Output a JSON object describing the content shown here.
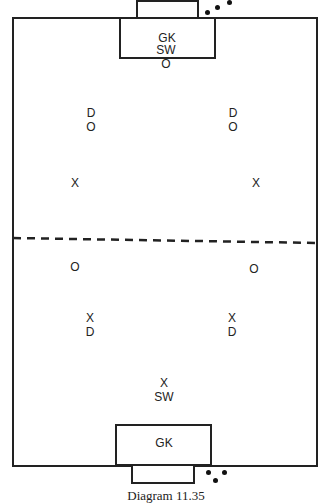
{
  "diagram": {
    "caption": "Diagram 11.35",
    "colors": {
      "lines": "#222222",
      "background": "#ffffff"
    },
    "top_goal": {
      "keeper_label": "GK"
    },
    "bottom_goal": {
      "keeper_label": "GK"
    },
    "players": [
      {
        "label": "SW",
        "x": 166,
        "y": 50
      },
      {
        "label": "O",
        "x": 166,
        "y": 64
      },
      {
        "label": "D",
        "x": 91,
        "y": 113
      },
      {
        "label": "O",
        "x": 91,
        "y": 127
      },
      {
        "label": "D",
        "x": 233,
        "y": 113
      },
      {
        "label": "O",
        "x": 233,
        "y": 127
      },
      {
        "label": "X",
        "x": 75,
        "y": 183
      },
      {
        "label": "X",
        "x": 256,
        "y": 183
      },
      {
        "label": "O",
        "x": 75,
        "y": 267
      },
      {
        "label": "O",
        "x": 254,
        "y": 269
      },
      {
        "label": "X",
        "x": 90,
        "y": 318
      },
      {
        "label": "D",
        "x": 90,
        "y": 332
      },
      {
        "label": "X",
        "x": 232,
        "y": 318
      },
      {
        "label": "D",
        "x": 232,
        "y": 332
      },
      {
        "label": "X",
        "x": 164,
        "y": 383
      },
      {
        "label": "SW",
        "x": 164,
        "y": 397
      }
    ]
  }
}
